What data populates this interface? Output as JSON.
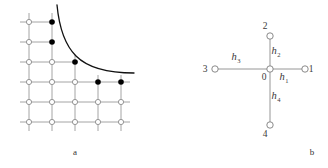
{
  "figure": {
    "background_color": "#ffffff",
    "panels": [
      {
        "id": "a",
        "caption": "a",
        "caption_position": {
          "x": 75,
          "y": 155
        },
        "description": "Rectangular mesh grid with open and filled nodes and a hyperbolic boundary curve"
      },
      {
        "id": "b",
        "caption": "b",
        "caption_position": {
          "x": 148,
          "y": 155
        },
        "description": "Five point stencil with central node 0 and neighbours 1,2,3,4 with step labels h1,h2,h3,h4"
      }
    ]
  },
  "panel_a": {
    "grid": {
      "columns_x": [
        29,
        52,
        75,
        98,
        121
      ],
      "rows_y": [
        22,
        42,
        62,
        82,
        102,
        122
      ],
      "line_color": "#9a9a9a",
      "line_width": 0.9,
      "stub_length": 9
    },
    "nodes": {
      "open_color_fill": "#ffffff",
      "open_color_stroke": "#8c8c8c",
      "open_radius": 2.6,
      "filled_color": "#000000",
      "filled_radius": 2.8,
      "filled_nodes": [
        {
          "col": 1,
          "row": 0
        },
        {
          "col": 1,
          "row": 1
        },
        {
          "col": 2,
          "row": 2
        },
        {
          "col": 3,
          "row": 3
        },
        {
          "col": 4,
          "row": 3
        }
      ],
      "open_nodes": [
        {
          "col": 0,
          "row": 0
        },
        {
          "col": 0,
          "row": 1
        },
        {
          "col": 0,
          "row": 2
        },
        {
          "col": 1,
          "row": 2
        },
        {
          "col": 0,
          "row": 3
        },
        {
          "col": 1,
          "row": 3
        },
        {
          "col": 2,
          "row": 3
        },
        {
          "col": 0,
          "row": 4
        },
        {
          "col": 1,
          "row": 4
        },
        {
          "col": 2,
          "row": 4
        },
        {
          "col": 3,
          "row": 4
        },
        {
          "col": 4,
          "row": 4
        },
        {
          "col": 0,
          "row": 5
        },
        {
          "col": 1,
          "row": 5
        },
        {
          "col": 2,
          "row": 5
        },
        {
          "col": 3,
          "row": 5
        },
        {
          "col": 4,
          "row": 5
        }
      ]
    },
    "curve": {
      "color": "#111111",
      "width": 1.3,
      "path": "M 57,5 C 59,26 64,44 76,56 C 88,68 108,73 134,73",
      "label": "hyperbolic boundary"
    },
    "visible_segments": {
      "horizontal": [
        {
          "row": 0,
          "from_x": 20,
          "to_x": 55
        },
        {
          "row": 1,
          "from_x": 20,
          "to_x": 55
        },
        {
          "row": 2,
          "from_x": 20,
          "to_x": 78
        },
        {
          "row": 3,
          "from_x": 20,
          "to_x": 130
        },
        {
          "row": 4,
          "from_x": 20,
          "to_x": 130
        },
        {
          "row": 5,
          "from_x": 20,
          "to_x": 130
        }
      ],
      "vertical": [
        {
          "col": 0,
          "from_y": 13,
          "to_y": 131
        },
        {
          "col": 1,
          "from_y": 13,
          "to_y": 131
        },
        {
          "col": 2,
          "from_y": 55,
          "to_y": 131
        },
        {
          "col": 3,
          "from_y": 75,
          "to_y": 131
        },
        {
          "col": 4,
          "from_y": 75,
          "to_y": 131
        }
      ]
    }
  },
  "panel_b": {
    "center": {
      "x": 106,
      "y": 69
    },
    "node_style": {
      "radius": 3.2,
      "fill": "#ffffff",
      "stroke": "#7d7d7d",
      "stroke_width": 0.9
    },
    "edge_style": {
      "color": "#8a8a8a",
      "width": 0.9
    },
    "nodes": [
      {
        "id": "0",
        "label": "0",
        "x": 106,
        "y": 69,
        "label_x": 100,
        "label_y": 80,
        "role": "center"
      },
      {
        "id": "1",
        "label": "1",
        "x": 141,
        "y": 69,
        "label_x": 147,
        "label_y": 72,
        "role": "east"
      },
      {
        "id": "2",
        "label": "2",
        "x": 106,
        "y": 36,
        "label_x": 101,
        "label_y": 29,
        "role": "north"
      },
      {
        "id": "3",
        "label": "3",
        "x": 51,
        "y": 69,
        "label_x": 41,
        "label_y": 72,
        "role": "west"
      },
      {
        "id": "4",
        "label": "4",
        "x": 106,
        "y": 125,
        "label_x": 101,
        "label_y": 137,
        "role": "south"
      }
    ],
    "edges": [
      {
        "from": "0",
        "to": "1",
        "label_base": "h",
        "label_sub": "1",
        "label_x": 120,
        "label_y": 80
      },
      {
        "from": "0",
        "to": "2",
        "label_base": "h",
        "label_sub": "2",
        "label_x": 112,
        "label_y": 54
      },
      {
        "from": "0",
        "to": "3",
        "label_base": "h",
        "label_sub": "3",
        "label_x": 72,
        "label_y": 60
      },
      {
        "from": "0",
        "to": "4",
        "label_base": "h",
        "label_sub": "4",
        "label_x": 112,
        "label_y": 99
      }
    ]
  }
}
